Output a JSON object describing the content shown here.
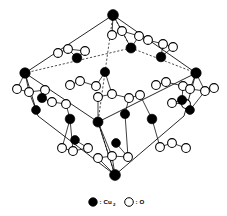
{
  "figure": {
    "background_color": "#ffffff",
    "line_color": "#000000"
  },
  "legend": {
    "items": [
      {
        "marker": "filled-circle",
        "marker_color": "#000000",
        "separator": ":",
        "label": "Cu",
        "subscript": "2"
      },
      {
        "marker": "open-circle",
        "marker_color": "#ffffff",
        "separator": ":",
        "label": "O",
        "subscript": ""
      }
    ]
  },
  "chart_data": {
    "type": "scatter",
    "xlabel": "",
    "ylabel": "",
    "cell_vertices": [
      {
        "name": "top",
        "x": 113,
        "y": 15
      },
      {
        "name": "upper-left",
        "x": 25,
        "y": 73
      },
      {
        "name": "upper-right",
        "x": 196,
        "y": 73
      },
      {
        "name": "left-lower",
        "x": 38,
        "y": 116
      },
      {
        "name": "right-lower",
        "x": 184,
        "y": 116
      },
      {
        "name": "center-lower",
        "x": 98,
        "y": 122
      },
      {
        "name": "bottom",
        "x": 115,
        "y": 175
      },
      {
        "name": "center-upper",
        "x": 131,
        "y": 48
      }
    ],
    "solid_edges": [
      [
        113,
        15,
        25,
        73
      ],
      [
        113,
        15,
        196,
        73
      ],
      [
        25,
        73,
        38,
        116
      ],
      [
        196,
        73,
        184,
        116
      ],
      [
        38,
        116,
        115,
        175
      ],
      [
        184,
        116,
        115,
        175
      ],
      [
        25,
        73,
        98,
        122
      ],
      [
        196,
        73,
        98,
        122
      ],
      [
        98,
        122,
        115,
        175
      ]
    ],
    "dashed_edges": [
      [
        113,
        15,
        131,
        48
      ],
      [
        131,
        48,
        25,
        73
      ],
      [
        131,
        48,
        196,
        73
      ],
      [
        113,
        15,
        98,
        122
      ],
      [
        98,
        122,
        115,
        175
      ]
    ],
    "copper_atoms": [
      {
        "x": 113,
        "y": 15,
        "r": 5.4
      },
      {
        "x": 25,
        "y": 73,
        "r": 5.2
      },
      {
        "x": 196,
        "y": 73,
        "r": 5.2
      },
      {
        "x": 115,
        "y": 175,
        "r": 5.4
      },
      {
        "x": 131,
        "y": 48,
        "r": 5.0
      },
      {
        "x": 98,
        "y": 122,
        "r": 5.0
      },
      {
        "x": 77,
        "y": 58,
        "r": 4.8
      },
      {
        "x": 161,
        "y": 57,
        "r": 4.8
      },
      {
        "x": 105,
        "y": 72,
        "r": 4.6
      },
      {
        "x": 70,
        "y": 119,
        "r": 4.8
      },
      {
        "x": 152,
        "y": 119,
        "r": 4.8
      },
      {
        "x": 42,
        "y": 98,
        "r": 4.6
      },
      {
        "x": 182,
        "y": 100,
        "r": 4.6
      },
      {
        "x": 125,
        "y": 114,
        "r": 4.6
      },
      {
        "x": 36,
        "y": 110,
        "r": 4.4
      },
      {
        "x": 190,
        "y": 110,
        "r": 4.4
      },
      {
        "x": 75,
        "y": 140,
        "r": 4.4
      },
      {
        "x": 116,
        "y": 143,
        "r": 4.4
      }
    ],
    "oxygen_atoms": [
      {
        "x": 58,
        "y": 53,
        "r": 4.4
      },
      {
        "x": 68,
        "y": 49,
        "r": 4.4
      },
      {
        "x": 85,
        "y": 51,
        "r": 4.4
      },
      {
        "x": 112,
        "y": 35,
        "r": 4.4
      },
      {
        "x": 122,
        "y": 31,
        "r": 4.4
      },
      {
        "x": 139,
        "y": 36,
        "r": 4.4
      },
      {
        "x": 148,
        "y": 40,
        "r": 4.4
      },
      {
        "x": 163,
        "y": 44,
        "r": 4.4
      },
      {
        "x": 173,
        "y": 47,
        "r": 4.4
      },
      {
        "x": 70,
        "y": 85,
        "r": 4.4
      },
      {
        "x": 80,
        "y": 81,
        "r": 4.4
      },
      {
        "x": 96,
        "y": 86,
        "r": 4.4
      },
      {
        "x": 98,
        "y": 97,
        "r": 4.4
      },
      {
        "x": 112,
        "y": 94,
        "r": 4.4
      },
      {
        "x": 129,
        "y": 98,
        "r": 4.4
      },
      {
        "x": 140,
        "y": 95,
        "r": 4.4
      },
      {
        "x": 156,
        "y": 85,
        "r": 4.4
      },
      {
        "x": 166,
        "y": 82,
        "r": 4.4
      },
      {
        "x": 183,
        "y": 86,
        "r": 4.4
      },
      {
        "x": 17,
        "y": 89,
        "r": 4.4
      },
      {
        "x": 29,
        "y": 92,
        "r": 4.4
      },
      {
        "x": 45,
        "y": 90,
        "r": 4.4
      },
      {
        "x": 52,
        "y": 102,
        "r": 4.4
      },
      {
        "x": 66,
        "y": 104,
        "r": 4.4
      },
      {
        "x": 190,
        "y": 89,
        "r": 4.4
      },
      {
        "x": 205,
        "y": 91,
        "r": 4.4
      },
      {
        "x": 214,
        "y": 88,
        "r": 4.4
      },
      {
        "x": 172,
        "y": 103,
        "r": 4.4
      },
      {
        "x": 186,
        "y": 104,
        "r": 4.4
      },
      {
        "x": 62,
        "y": 148,
        "r": 4.4
      },
      {
        "x": 73,
        "y": 151,
        "r": 4.4
      },
      {
        "x": 88,
        "y": 148,
        "r": 4.4
      },
      {
        "x": 98,
        "y": 158,
        "r": 4.4
      },
      {
        "x": 112,
        "y": 156,
        "r": 4.4
      },
      {
        "x": 128,
        "y": 157,
        "r": 4.4
      },
      {
        "x": 160,
        "y": 147,
        "r": 4.4
      },
      {
        "x": 172,
        "y": 143,
        "r": 4.4
      },
      {
        "x": 186,
        "y": 148,
        "r": 4.4
      }
    ],
    "bonds": [
      [
        58,
        53,
        68,
        49
      ],
      [
        68,
        49,
        85,
        51
      ],
      [
        112,
        35,
        122,
        31
      ],
      [
        122,
        31,
        139,
        36
      ],
      [
        139,
        36,
        148,
        40
      ],
      [
        148,
        40,
        163,
        44
      ],
      [
        163,
        44,
        173,
        47
      ],
      [
        70,
        85,
        80,
        81
      ],
      [
        80,
        81,
        96,
        86
      ],
      [
        98,
        97,
        112,
        94
      ],
      [
        112,
        94,
        129,
        98
      ],
      [
        129,
        98,
        140,
        95
      ],
      [
        156,
        85,
        166,
        82
      ],
      [
        166,
        82,
        183,
        86
      ],
      [
        17,
        89,
        29,
        92
      ],
      [
        29,
        92,
        45,
        90
      ],
      [
        52,
        102,
        66,
        104
      ],
      [
        190,
        89,
        205,
        91
      ],
      [
        205,
        91,
        214,
        88
      ],
      [
        172,
        103,
        186,
        104
      ],
      [
        62,
        148,
        73,
        151
      ],
      [
        73,
        151,
        88,
        148
      ],
      [
        98,
        158,
        112,
        156
      ],
      [
        112,
        156,
        128,
        157
      ],
      [
        160,
        147,
        172,
        143
      ],
      [
        172,
        143,
        186,
        148
      ],
      [
        131,
        48,
        139,
        36
      ],
      [
        131,
        48,
        122,
        31
      ],
      [
        113,
        15,
        112,
        35
      ],
      [
        113,
        15,
        122,
        31
      ],
      [
        98,
        122,
        98,
        97
      ],
      [
        98,
        122,
        112,
        156
      ],
      [
        115,
        175,
        112,
        156
      ],
      [
        115,
        175,
        98,
        158
      ],
      [
        25,
        73,
        17,
        89
      ],
      [
        25,
        73,
        29,
        92
      ],
      [
        196,
        73,
        205,
        91
      ],
      [
        196,
        73,
        190,
        89
      ],
      [
        77,
        58,
        85,
        51
      ],
      [
        77,
        58,
        68,
        49
      ],
      [
        161,
        57,
        163,
        44
      ],
      [
        161,
        57,
        173,
        47
      ],
      [
        105,
        72,
        96,
        86
      ],
      [
        105,
        72,
        112,
        94
      ],
      [
        70,
        119,
        66,
        104
      ],
      [
        70,
        119,
        62,
        148
      ],
      [
        70,
        119,
        73,
        151
      ],
      [
        152,
        119,
        140,
        95
      ],
      [
        152,
        119,
        160,
        147
      ],
      [
        42,
        98,
        45,
        90
      ],
      [
        42,
        98,
        52,
        102
      ],
      [
        182,
        100,
        183,
        86
      ],
      [
        182,
        100,
        172,
        103
      ],
      [
        125,
        114,
        129,
        98
      ],
      [
        125,
        114,
        128,
        157
      ],
      [
        36,
        110,
        29,
        92
      ],
      [
        190,
        110,
        205,
        91
      ],
      [
        75,
        140,
        88,
        148
      ],
      [
        116,
        143,
        128,
        157
      ]
    ]
  }
}
